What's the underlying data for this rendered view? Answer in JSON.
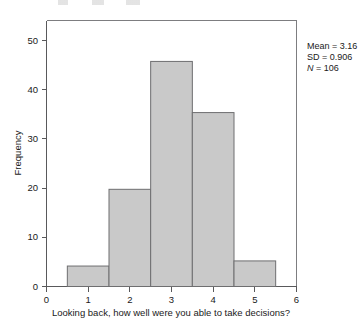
{
  "chart_data": {
    "type": "bar",
    "title": "",
    "subtitle": "",
    "xlabel": "Looking back, how well were you able to take decisions?",
    "ylabel": "Frequency",
    "categories": [
      "1",
      "2",
      "3",
      "4",
      "5"
    ],
    "values": [
      4,
      19,
      44,
      34,
      5
    ],
    "bin_edges": [
      0.5,
      1.5,
      2.5,
      3.5,
      4.5,
      5.5
    ],
    "bin_width": 1,
    "xlim": [
      0,
      6
    ],
    "ylim": [
      0,
      52
    ],
    "x_ticks": [
      "0",
      "1",
      "2",
      "3",
      "4",
      "5",
      "6"
    ],
    "x_tick_values": [
      0,
      1,
      2,
      3,
      4,
      5,
      6
    ],
    "y_ticks": [
      "0",
      "10",
      "20",
      "30",
      "40",
      "50"
    ],
    "y_tick_values": [
      0,
      10,
      20,
      30,
      40,
      50
    ],
    "grid": false,
    "legend": null,
    "bar_fill": "#c9c9c9",
    "bar_stroke": "#6e6e70",
    "annotations": [
      {
        "name": "mean",
        "text": "Mean = 3.16"
      },
      {
        "name": "sd",
        "text": "SD = 0.906"
      },
      {
        "name": "n",
        "text_italic": "N",
        "text": " = 106"
      }
    ]
  },
  "stats_box": {
    "mean_label": "Mean = 3.16",
    "sd_label": "SD = 0.906",
    "n_italic": "N",
    "n_value": " = 106"
  },
  "axes": {
    "y_title": "Frequency",
    "x_title": "Looking back, how well were you able to take decisions?"
  }
}
